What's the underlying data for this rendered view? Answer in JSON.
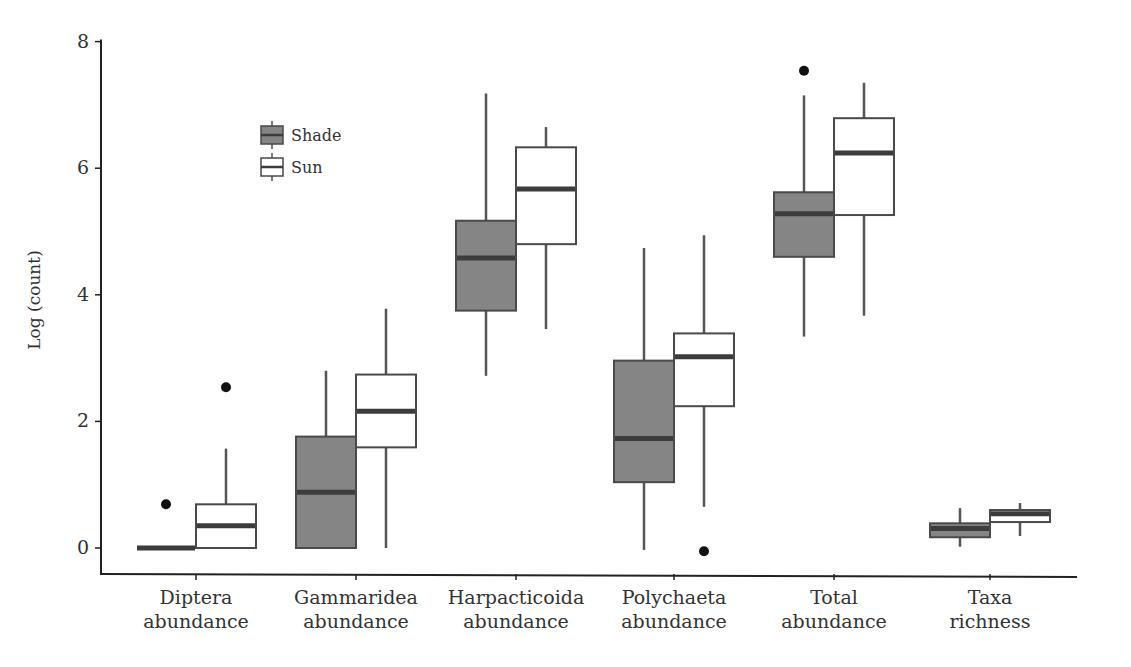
{
  "chart_data": {
    "type": "boxplot",
    "title": "",
    "xlabel": "",
    "ylabel": "Log (count)",
    "ylim": [
      0,
      8
    ],
    "yticks": [
      0,
      2,
      4,
      6,
      8
    ],
    "grid": false,
    "legend_position": "upper-left (inside)",
    "legend": [
      {
        "name": "Shade",
        "fill": "#858585"
      },
      {
        "name": "Sun",
        "fill": "#ffffff"
      }
    ],
    "categories": [
      [
        "Diptera",
        "abundance"
      ],
      [
        "Gammaridea",
        "abundance"
      ],
      [
        "Harpacticoida",
        "abundance"
      ],
      [
        "Polychaeta",
        "abundance"
      ],
      [
        "Total",
        "abundance"
      ],
      [
        "Taxa",
        "richness"
      ]
    ],
    "series": [
      {
        "name": "Shade",
        "boxes": [
          {
            "whisker_low": 0.0,
            "q1": 0.0,
            "median": 0.0,
            "q3": 0.0,
            "whisker_high": 0.0,
            "outliers": [
              0.69
            ]
          },
          {
            "whisker_low": 0.0,
            "q1": 0.0,
            "median": 0.88,
            "q3": 1.76,
            "whisker_high": 2.8,
            "outliers": []
          },
          {
            "whisker_low": 2.72,
            "q1": 3.75,
            "median": 4.58,
            "q3": 5.17,
            "whisker_high": 7.18,
            "outliers": []
          },
          {
            "whisker_low": -0.03,
            "q1": 1.04,
            "median": 1.73,
            "q3": 2.96,
            "whisker_high": 4.74,
            "outliers": []
          },
          {
            "whisker_low": 3.34,
            "q1": 4.6,
            "median": 5.28,
            "q3": 5.62,
            "whisker_high": 7.15,
            "outliers": [
              7.54
            ]
          },
          {
            "whisker_low": 0.02,
            "q1": 0.17,
            "median": 0.31,
            "q3": 0.39,
            "whisker_high": 0.63,
            "outliers": []
          }
        ]
      },
      {
        "name": "Sun",
        "boxes": [
          {
            "whisker_low": 0.0,
            "q1": 0.0,
            "median": 0.35,
            "q3": 0.69,
            "whisker_high": 1.57,
            "outliers": [
              2.54
            ]
          },
          {
            "whisker_low": 0.0,
            "q1": 1.59,
            "median": 2.16,
            "q3": 2.74,
            "whisker_high": 3.78,
            "outliers": []
          },
          {
            "whisker_low": 3.46,
            "q1": 4.8,
            "median": 5.67,
            "q3": 6.33,
            "whisker_high": 6.65,
            "outliers": []
          },
          {
            "whisker_low": 0.65,
            "q1": 2.24,
            "median": 3.02,
            "q3": 3.39,
            "whisker_high": 4.94,
            "outliers": [
              -0.05
            ]
          },
          {
            "whisker_low": 3.67,
            "q1": 5.26,
            "median": 6.24,
            "q3": 6.79,
            "whisker_high": 7.35,
            "outliers": []
          },
          {
            "whisker_low": 0.19,
            "q1": 0.41,
            "median": 0.54,
            "q3": 0.6,
            "whisker_high": 0.71,
            "outliers": []
          }
        ]
      }
    ]
  },
  "colors": {
    "shade_fill": "#858585",
    "sun_fill": "#ffffff",
    "median": "#3c3c3c",
    "box_stroke": "#4a4a4a",
    "axis": "#222222"
  }
}
